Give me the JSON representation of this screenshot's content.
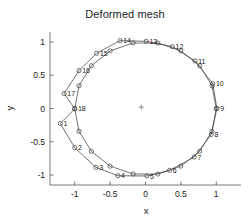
{
  "figure": {
    "window_name": "Deformed mesh",
    "background_color": "#ffffff",
    "line_color": "#3a3a3a",
    "axis_color": "#555555"
  },
  "chart_data": {
    "type": "line",
    "title": "Deformed mesh",
    "xlabel": "x",
    "ylabel": "y",
    "xlim": [
      -1.35,
      1.35
    ],
    "ylim": [
      -1.15,
      1.15
    ],
    "xticks": [
      -1,
      -0.5,
      0,
      0.5,
      1
    ],
    "xtick_labels": [
      "-1",
      "-0.5",
      "0",
      "0.5",
      "1"
    ],
    "yticks": [
      -1,
      -0.5,
      0,
      0.5,
      1
    ],
    "ytick_labels": [
      "-1",
      "-0.5",
      "0",
      "0.5",
      "1"
    ],
    "grid": false,
    "legend": null,
    "annotations": [
      {
        "name": "center-cross",
        "x": -0.06,
        "y": 0.02,
        "marker": "+"
      }
    ],
    "series": [
      {
        "name": "Undeformed mesh",
        "closed": true,
        "marker": "circle",
        "labeled": false,
        "x": [
          -1.0,
          -0.94,
          -0.766,
          -0.5,
          -0.174,
          0.174,
          0.5,
          0.766,
          0.94,
          1.0,
          0.94,
          0.766,
          0.5,
          0.174,
          -0.174,
          -0.5,
          -0.766,
          -0.94
        ],
        "y": [
          0.0,
          -0.342,
          -0.643,
          -0.866,
          -0.985,
          -0.985,
          -0.866,
          -0.643,
          -0.342,
          0.0,
          0.342,
          0.643,
          0.866,
          0.985,
          0.985,
          0.866,
          0.643,
          0.342
        ]
      },
      {
        "name": "Deformed mesh",
        "closed": true,
        "marker": "circle",
        "labeled": true,
        "node_labels": [
          "1",
          "2",
          "3",
          "4",
          "5",
          "6",
          "7",
          "8",
          "9",
          "10",
          "11",
          "12",
          "13",
          "14",
          "15",
          "16",
          "17",
          "18"
        ],
        "x": [
          -1.205,
          -1.0,
          -0.7,
          -0.39,
          0.02,
          0.34,
          0.69,
          0.93,
          1.01,
          0.95,
          0.7,
          0.38,
          0.01,
          -0.36,
          -0.69,
          -0.94,
          -1.15,
          -1.0
        ],
        "y": [
          -0.225,
          -0.59,
          -0.885,
          -1.01,
          -1.015,
          -0.93,
          -0.73,
          -0.39,
          0.0,
          0.375,
          0.715,
          0.93,
          1.01,
          1.02,
          0.83,
          0.57,
          0.225,
          -0.005
        ]
      }
    ]
  }
}
